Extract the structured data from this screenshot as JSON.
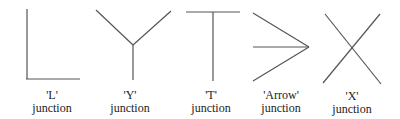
{
  "diagram": {
    "junctions": [
      {
        "id": "l",
        "name": "'L'",
        "suffix": "junction",
        "lines": [
          [
            27,
            9,
            27,
            79
          ],
          [
            26,
            79,
            80,
            79
          ]
        ],
        "label_center_x": 52
      },
      {
        "id": "y",
        "name": "'Y'",
        "suffix": "junction",
        "lines": [
          [
            96,
            10,
            133,
            45
          ],
          [
            171,
            11,
            133,
            45
          ],
          [
            133,
            45,
            133,
            80
          ]
        ],
        "label_center_x": 130
      },
      {
        "id": "t",
        "name": "'T'",
        "suffix": "junction",
        "lines": [
          [
            186,
            12,
            240,
            12
          ],
          [
            213,
            12,
            213,
            81
          ]
        ],
        "label_center_x": 211
      },
      {
        "id": "arrow",
        "name": "'Arrow'",
        "suffix": "junction",
        "lines": [
          [
            253,
            13,
            309,
            47
          ],
          [
            253,
            47,
            309,
            47
          ],
          [
            253,
            81,
            309,
            47
          ]
        ],
        "label_center_x": 281
      },
      {
        "id": "x",
        "name": "'X'",
        "suffix": "junction",
        "lines": [
          [
            325,
            14,
            381,
            84
          ],
          [
            380,
            14,
            323,
            83
          ]
        ],
        "label_center_x": 352
      }
    ],
    "line_color": "#555555"
  }
}
